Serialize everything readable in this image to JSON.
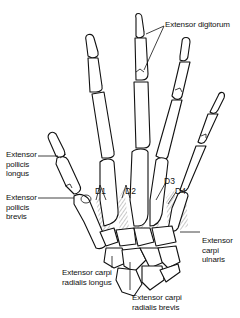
{
  "figure": {
    "labels": {
      "extensor_digitorum": "Extensor digitorum",
      "extensor_pollicis_longus": "Extensor\npollicis\nlongus",
      "extensor_pollicis_brevis": "Extensor\npollicis\nbrevis",
      "extensor_carpi_ulnaris": "Extensor\ncarpi\nulnaris",
      "extensor_carpi_radialis_longus": "Extensor carpi\nradialis longus",
      "extensor_carpi_radialis_brevis": "Extensor carpi\nradialis brevis"
    },
    "interossei": {
      "d1": "D1",
      "d2": "D2",
      "d3": "D3",
      "d4": "D4"
    },
    "colors": {
      "line": "#111111",
      "hatch": "#9a9a9a",
      "background": "#ffffff"
    }
  }
}
